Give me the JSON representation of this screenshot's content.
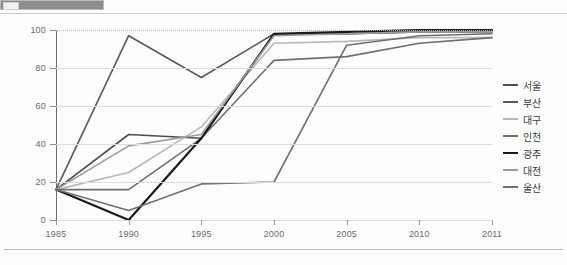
{
  "topbar": {
    "present": true
  },
  "chart_data": {
    "type": "line",
    "title": "",
    "xlabel": "",
    "ylabel": "",
    "x": [
      "1985",
      "1990",
      "1995",
      "2000",
      "2005",
      "2010",
      "2011"
    ],
    "xtick_labels": [
      "1985",
      "1990",
      "1995",
      "2000",
      "2005",
      "2010",
      "2011"
    ],
    "ytick_labels": [
      "0",
      "20",
      "40",
      "60",
      "80",
      "100"
    ],
    "yticks": [
      0,
      20,
      40,
      60,
      80,
      100
    ],
    "ylim": [
      0,
      100
    ],
    "grid": true,
    "grid_style": "horizontal solid, top line dotted",
    "legend_position": "right",
    "series": [
      {
        "name": "서울",
        "color": "#4d4d4d",
        "width": 1.6,
        "values": [
          16,
          45,
          43,
          98,
          98,
          99,
          99
        ]
      },
      {
        "name": "부산",
        "color": "#595959",
        "width": 1.6,
        "values": [
          16,
          97,
          75,
          98,
          98,
          99,
          100
        ]
      },
      {
        "name": "대구",
        "color": "#b8b8b8",
        "width": 1.6,
        "values": [
          16,
          25,
          49,
          93,
          94,
          96,
          96
        ]
      },
      {
        "name": "인천",
        "color": "#6e6e6e",
        "width": 1.6,
        "values": [
          16,
          16,
          43,
          84,
          86,
          93,
          96
        ]
      },
      {
        "name": "광주",
        "color": "#1a1a1a",
        "width": 2.2,
        "values": [
          16,
          0,
          43,
          98,
          99,
          100,
          100
        ]
      },
      {
        "name": "대전",
        "color": "#9b9b9b",
        "width": 1.6,
        "values": [
          16,
          39,
          45,
          97,
          98,
          99,
          99
        ]
      },
      {
        "name": "울산",
        "color": "#707070",
        "width": 1.6,
        "values": [
          16,
          5,
          19,
          20,
          92,
          97,
          98
        ]
      }
    ]
  }
}
